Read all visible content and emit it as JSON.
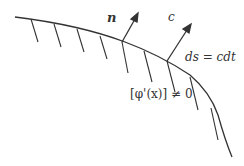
{
  "diagram": {
    "labels": {
      "normal": "n",
      "speed": "c",
      "arc_length": "ds = cdt",
      "jump_condition": "[φ'(x)] ≠ 0"
    },
    "colors": {
      "line": "#333333",
      "background": "#ffffff"
    }
  }
}
